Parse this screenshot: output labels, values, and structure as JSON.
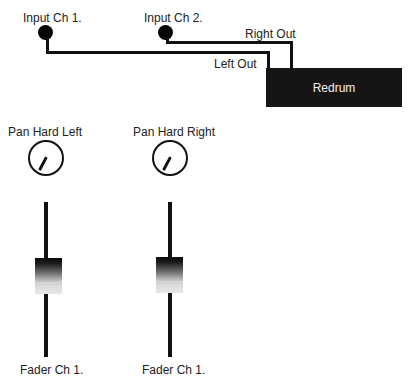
{
  "inputs": [
    {
      "label": "Input Ch 1."
    },
    {
      "label": "Input Ch 2."
    }
  ],
  "outputs": {
    "right_label": "Right Out",
    "left_label": "Left Out"
  },
  "device": {
    "label": "Redrum",
    "color": "#151515"
  },
  "channels": [
    {
      "pan_label": "Pan Hard Left",
      "pan_position": "hard-left",
      "fader_label": "Fader Ch 1."
    },
    {
      "pan_label": "Pan Hard Right",
      "pan_position": "hard-right",
      "fader_label": "Fader Ch 1."
    }
  ]
}
